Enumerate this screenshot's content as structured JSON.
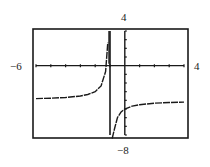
{
  "chart_data": {
    "type": "line",
    "title": "",
    "xlabel": "",
    "ylabel": "",
    "xlim": [
      -6,
      4
    ],
    "ylim": [
      -8,
      4
    ],
    "window_labels": {
      "xmin": "−6",
      "xmax": "4",
      "ymax": "4",
      "ymin": "−8"
    },
    "x_tick_step": 1,
    "y_tick_step": 1,
    "grid": false,
    "legend": null,
    "vertical_asymptote_x": -1,
    "horizontal_asymptote_y": -4,
    "series": [
      {
        "name": "left branch",
        "x": [
          -6,
          -5,
          -4,
          -3,
          -2.5,
          -2,
          -1.6,
          -1.3,
          -1.15
        ],
        "y": [
          -3.8,
          -3.75,
          -3.67,
          -3.5,
          -3.33,
          -3.0,
          -2.33,
          -0.67,
          2.67
        ]
      },
      {
        "name": "right branch",
        "x": [
          -0.85,
          -0.7,
          -0.5,
          -0.25,
          0,
          0.5,
          1,
          2,
          3,
          4
        ],
        "y": [
          -10.67,
          -7.33,
          -6.0,
          -5.33,
          -5.0,
          -4.67,
          -4.5,
          -4.33,
          -4.25,
          -4.2
        ]
      }
    ]
  }
}
